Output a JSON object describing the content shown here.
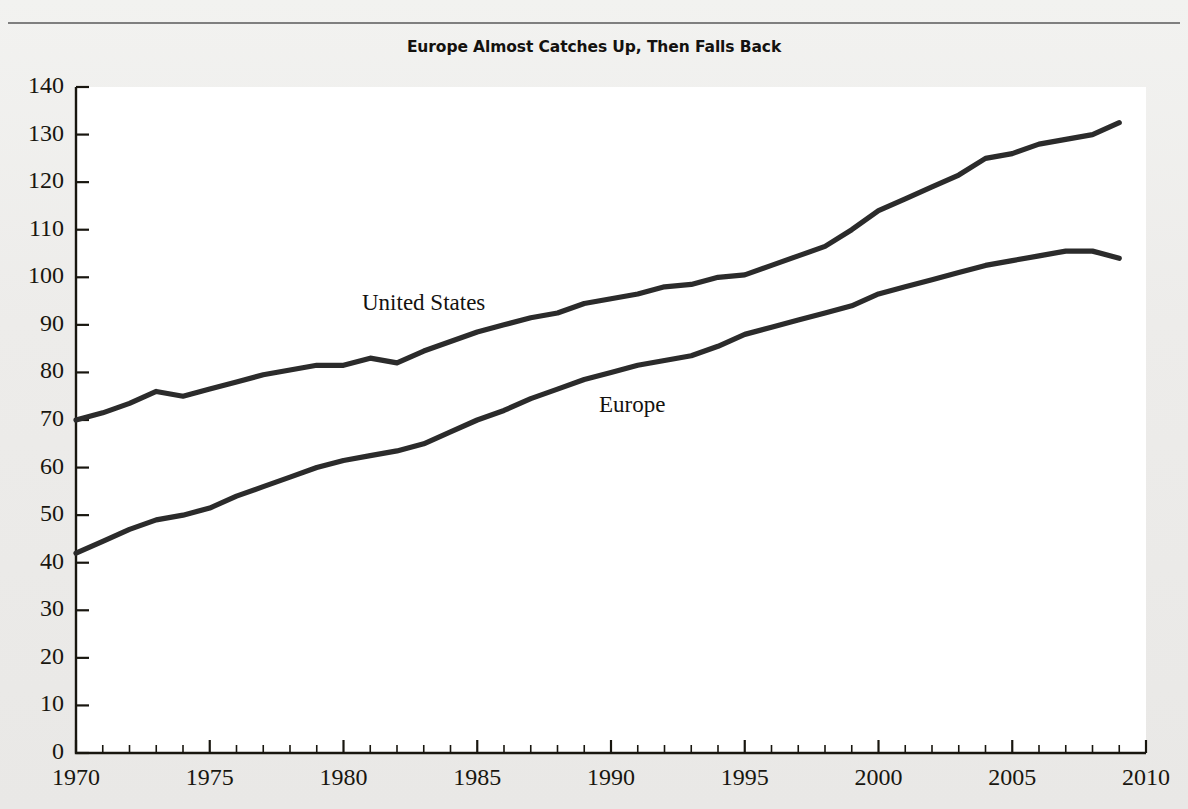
{
  "figure": {
    "title": "Europe Almost Catches Up, Then Falls Back",
    "background_color": "#edecea",
    "plot_background_color": "#ffffff",
    "line_color": "#2b2b2b",
    "axis_color": "#18160f"
  },
  "annotations": [
    {
      "name": "united-states",
      "text": "United States"
    },
    {
      "name": "europe",
      "text": "Europe"
    }
  ],
  "chart_data": {
    "type": "line",
    "title": "Europe Almost Catches Up, Then Falls Back",
    "xlabel": "",
    "ylabel": "",
    "xlim": [
      1970,
      2010
    ],
    "ylim": [
      0,
      140
    ],
    "grid": false,
    "legend": "inline-annotations",
    "y_ticks": [
      0,
      10,
      20,
      30,
      40,
      50,
      60,
      70,
      80,
      90,
      100,
      110,
      120,
      130,
      140
    ],
    "x_ticks": [
      1970,
      1975,
      1980,
      1985,
      1990,
      1995,
      2000,
      2005,
      2010
    ],
    "x_minor_tick_step": 1,
    "x": [
      1970,
      1971,
      1972,
      1973,
      1974,
      1975,
      1976,
      1977,
      1978,
      1979,
      1980,
      1981,
      1982,
      1983,
      1984,
      1985,
      1986,
      1987,
      1988,
      1989,
      1990,
      1991,
      1992,
      1993,
      1994,
      1995,
      1996,
      1997,
      1998,
      1999,
      2000,
      2001,
      2002,
      2003,
      2004,
      2005,
      2006,
      2007,
      2008,
      2009
    ],
    "series": [
      {
        "name": "United States",
        "values": [
          70.0,
          71.5,
          73.5,
          76.0,
          75.0,
          76.5,
          78.0,
          79.5,
          80.5,
          81.5,
          81.5,
          83.0,
          82.0,
          84.5,
          86.5,
          88.5,
          90.0,
          91.5,
          92.5,
          94.5,
          95.5,
          96.5,
          98.0,
          98.5,
          100.0,
          100.5,
          102.5,
          104.5,
          106.5,
          110.0,
          114.0,
          116.5,
          119.0,
          121.5,
          125.0,
          126.0,
          128.0,
          129.0,
          130.0,
          132.5
        ]
      },
      {
        "name": "Europe",
        "values": [
          42.0,
          44.5,
          47.0,
          49.0,
          50.0,
          51.5,
          54.0,
          56.0,
          58.0,
          60.0,
          61.5,
          62.5,
          63.5,
          65.0,
          67.5,
          70.0,
          72.0,
          74.5,
          76.5,
          78.5,
          80.0,
          81.5,
          82.5,
          83.5,
          85.5,
          88.0,
          89.5,
          91.0,
          92.5,
          94.0,
          96.5,
          98.0,
          99.5,
          101.0,
          102.5,
          103.5,
          104.5,
          105.5,
          105.5,
          104.0
        ]
      }
    ]
  }
}
